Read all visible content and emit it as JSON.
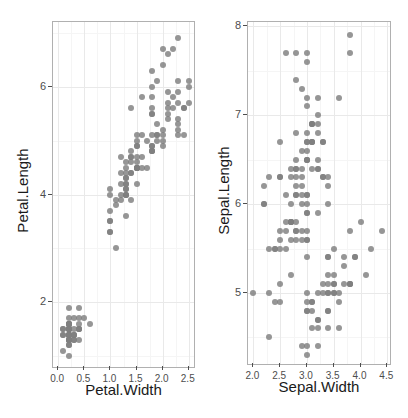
{
  "figure": {
    "background": "#ffffff",
    "point_color": "#7f7f7f",
    "grid_major_color": "#e9e9e9",
    "grid_minor_color": "#f5f5f5",
    "panel_border_color": "#b0b0b0"
  },
  "chart_data": [
    {
      "type": "scatter",
      "title": "",
      "xlabel": "Petal.Width",
      "ylabel": "Petal.Length",
      "xlim": [
        -0.1,
        2.6
      ],
      "ylim": [
        0.8,
        7.2
      ],
      "xticks": [
        0.0,
        0.5,
        1.0,
        1.5,
        2.0,
        2.5
      ],
      "xticklabels": [
        "0.0",
        "0.5",
        "1.0",
        "1.5",
        "2.0",
        "2.5"
      ],
      "yticks": [
        2,
        4,
        6
      ],
      "yticklabels": [
        "2",
        "4",
        "6"
      ],
      "xminor": [
        0.25,
        0.75,
        1.25,
        1.75,
        2.25
      ],
      "yminor": [
        1,
        3,
        5,
        7
      ],
      "grid": true,
      "legend": "none",
      "x": [
        0.2,
        0.2,
        0.2,
        0.2,
        0.2,
        0.4,
        0.3,
        0.2,
        0.2,
        0.1,
        0.2,
        0.2,
        0.1,
        0.1,
        0.2,
        0.4,
        0.4,
        0.3,
        0.3,
        0.3,
        0.2,
        0.4,
        0.2,
        0.5,
        0.2,
        0.2,
        0.4,
        0.2,
        0.2,
        0.2,
        0.2,
        0.4,
        0.1,
        0.2,
        0.2,
        0.2,
        0.2,
        0.1,
        0.2,
        0.2,
        0.3,
        0.3,
        0.2,
        0.6,
        0.4,
        0.3,
        0.2,
        0.2,
        0.2,
        0.2,
        1.4,
        1.5,
        1.5,
        1.3,
        1.5,
        1.3,
        1.6,
        1.0,
        1.3,
        1.4,
        1.0,
        1.5,
        1.0,
        1.4,
        1.3,
        1.4,
        1.5,
        1.0,
        1.5,
        1.1,
        1.8,
        1.3,
        1.5,
        1.2,
        1.3,
        1.4,
        1.4,
        1.7,
        1.5,
        1.0,
        1.1,
        1.0,
        1.2,
        1.6,
        1.5,
        1.6,
        1.5,
        1.3,
        1.3,
        1.3,
        1.2,
        1.4,
        1.2,
        1.0,
        1.3,
        1.2,
        1.3,
        1.3,
        1.1,
        1.3,
        2.5,
        1.9,
        2.1,
        1.8,
        2.2,
        2.1,
        1.7,
        1.8,
        1.8,
        2.5,
        2.0,
        1.9,
        2.1,
        2.0,
        2.4,
        2.3,
        1.8,
        2.2,
        2.3,
        1.5,
        2.3,
        2.0,
        2.0,
        1.8,
        2.1,
        1.8,
        1.8,
        1.8,
        2.1,
        1.6,
        1.9,
        2.0,
        2.2,
        1.5,
        1.4,
        2.3,
        2.4,
        1.8,
        1.8,
        2.1,
        2.4,
        2.3,
        1.9,
        2.3,
        2.5,
        2.3,
        1.9,
        2.0,
        2.3,
        1.8
      ],
      "y": [
        1.4,
        1.4,
        1.3,
        1.5,
        1.4,
        1.7,
        1.4,
        1.5,
        1.4,
        1.5,
        1.5,
        1.6,
        1.4,
        1.1,
        1.2,
        1.5,
        1.3,
        1.4,
        1.7,
        1.5,
        1.7,
        1.5,
        1.0,
        1.7,
        1.9,
        1.6,
        1.6,
        1.5,
        1.4,
        1.6,
        1.6,
        1.5,
        1.5,
        1.4,
        1.5,
        1.2,
        1.3,
        1.4,
        1.3,
        1.5,
        1.3,
        1.3,
        1.3,
        1.6,
        1.9,
        1.4,
        1.6,
        1.4,
        1.5,
        1.4,
        4.7,
        4.5,
        4.9,
        4.0,
        4.6,
        4.5,
        4.7,
        3.3,
        4.6,
        3.9,
        3.5,
        4.2,
        4.0,
        4.7,
        3.6,
        4.4,
        4.5,
        4.1,
        4.5,
        3.9,
        4.8,
        4.0,
        4.9,
        4.7,
        4.3,
        4.4,
        4.8,
        5.0,
        4.5,
        3.5,
        3.8,
        3.7,
        3.9,
        5.1,
        4.5,
        4.5,
        4.7,
        4.4,
        4.1,
        4.0,
        4.4,
        4.6,
        4.0,
        3.3,
        4.2,
        4.2,
        4.2,
        4.3,
        3.0,
        4.1,
        6.0,
        5.1,
        5.9,
        5.6,
        5.8,
        6.6,
        4.5,
        6.3,
        5.8,
        6.1,
        5.1,
        5.3,
        5.5,
        5.0,
        5.1,
        5.3,
        5.5,
        6.7,
        6.9,
        5.0,
        5.7,
        4.9,
        6.7,
        4.9,
        5.7,
        6.0,
        4.8,
        4.9,
        5.6,
        5.8,
        6.1,
        6.4,
        5.6,
        5.1,
        5.6,
        6.1,
        5.6,
        5.5,
        4.8,
        5.4,
        5.6,
        5.1,
        5.1,
        5.9,
        5.7,
        5.2,
        5.0,
        5.2,
        5.4,
        5.1
      ]
    },
    {
      "type": "scatter",
      "title": "",
      "xlabel": "Sepal.Width",
      "ylabel": "Sepal.Length",
      "xlim": [
        1.9,
        4.55
      ],
      "ylim": [
        4.2,
        8.05
      ],
      "xticks": [
        2.0,
        2.5,
        3.0,
        3.5,
        4.0,
        4.5
      ],
      "xticklabels": [
        "2.0",
        "2.5",
        "3.0",
        "3.5",
        "4.0",
        "4.5"
      ],
      "yticks": [
        5,
        6,
        7,
        8
      ],
      "yticklabels": [
        "5",
        "6",
        "7",
        "8"
      ],
      "xminor": [
        2.25,
        2.75,
        3.25,
        3.75,
        4.25
      ],
      "yminor": [
        4.5,
        5.5,
        6.5,
        7.5
      ],
      "grid": true,
      "legend": "none",
      "x": [
        3.5,
        3.0,
        3.2,
        3.1,
        3.6,
        3.9,
        3.4,
        3.4,
        2.9,
        3.1,
        3.7,
        3.4,
        3.0,
        3.0,
        4.0,
        4.4,
        3.9,
        3.5,
        3.8,
        3.8,
        3.4,
        3.7,
        3.6,
        3.3,
        3.4,
        3.0,
        3.4,
        3.5,
        3.4,
        3.2,
        3.1,
        3.4,
        4.1,
        4.2,
        3.1,
        3.2,
        3.5,
        3.6,
        3.0,
        3.4,
        3.5,
        2.3,
        3.2,
        3.5,
        3.8,
        3.0,
        3.8,
        3.2,
        3.7,
        3.3,
        3.2,
        3.2,
        3.1,
        2.3,
        2.8,
        2.8,
        3.3,
        2.4,
        2.9,
        2.7,
        2.0,
        3.0,
        2.2,
        2.9,
        2.9,
        3.1,
        3.0,
        2.7,
        2.2,
        2.5,
        3.2,
        2.8,
        2.5,
        2.8,
        2.9,
        3.0,
        2.8,
        3.0,
        2.9,
        2.6,
        2.4,
        2.4,
        2.7,
        2.7,
        3.0,
        3.4,
        3.1,
        2.3,
        3.0,
        2.5,
        2.6,
        3.0,
        2.6,
        2.3,
        2.7,
        3.0,
        2.9,
        2.9,
        2.5,
        2.8,
        3.3,
        2.7,
        3.0,
        2.9,
        3.0,
        3.0,
        2.5,
        2.9,
        2.5,
        3.6,
        3.2,
        2.7,
        3.0,
        2.5,
        2.8,
        3.2,
        3.0,
        3.8,
        2.6,
        2.2,
        3.2,
        2.8,
        2.8,
        2.7,
        3.3,
        3.2,
        2.8,
        3.0,
        2.8,
        3.0,
        2.8,
        3.8,
        2.8,
        2.8,
        2.6,
        3.0,
        3.4,
        3.1,
        3.0,
        3.1,
        3.1,
        3.1,
        2.7,
        3.2,
        3.3,
        3.0,
        2.5,
        3.0,
        3.4,
        3.0
      ],
      "y": [
        5.1,
        4.9,
        4.7,
        4.6,
        5.0,
        5.4,
        4.6,
        5.0,
        4.4,
        4.9,
        5.4,
        4.8,
        4.8,
        4.3,
        5.8,
        5.7,
        5.4,
        5.1,
        5.7,
        5.1,
        5.4,
        5.1,
        4.6,
        5.1,
        4.8,
        5.0,
        5.0,
        5.2,
        5.2,
        4.7,
        4.8,
        5.4,
        5.2,
        5.5,
        4.9,
        5.0,
        5.5,
        4.9,
        4.4,
        5.1,
        5.0,
        4.5,
        4.4,
        5.0,
        5.1,
        4.8,
        5.1,
        4.6,
        5.3,
        5.0,
        7.0,
        6.4,
        6.9,
        5.5,
        6.5,
        5.7,
        6.3,
        4.9,
        6.6,
        5.2,
        5.0,
        5.9,
        6.0,
        6.1,
        5.6,
        6.7,
        5.6,
        5.8,
        6.2,
        5.6,
        5.9,
        6.1,
        6.3,
        6.1,
        6.4,
        6.6,
        6.8,
        6.7,
        6.0,
        5.7,
        5.5,
        5.5,
        5.8,
        6.0,
        5.4,
        6.0,
        6.7,
        6.3,
        5.6,
        5.5,
        5.5,
        6.1,
        5.8,
        5.0,
        5.6,
        5.7,
        5.7,
        6.2,
        5.1,
        5.7,
        6.3,
        5.8,
        7.1,
        6.3,
        6.5,
        7.6,
        4.9,
        7.3,
        6.7,
        7.2,
        6.5,
        6.4,
        6.8,
        5.7,
        5.8,
        6.4,
        6.5,
        7.7,
        7.7,
        6.0,
        6.9,
        5.6,
        7.7,
        6.3,
        6.7,
        7.2,
        6.2,
        6.1,
        6.4,
        7.2,
        7.4,
        7.9,
        6.4,
        6.3,
        6.1,
        7.7,
        6.3,
        6.4,
        6.0,
        6.9,
        6.7,
        6.9,
        5.8,
        6.8,
        6.7,
        6.7,
        6.3,
        6.5,
        6.2,
        5.9
      ]
    }
  ]
}
